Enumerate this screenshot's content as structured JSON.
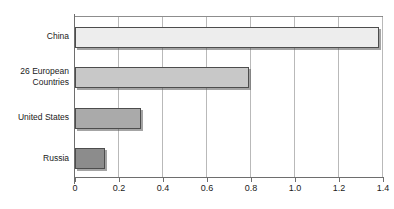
{
  "chart_data": {
    "type": "bar",
    "orientation": "horizontal",
    "title": "",
    "xlabel": "",
    "ylabel": "",
    "xlim": [
      0,
      1.4
    ],
    "grid": true,
    "legend": "none",
    "categories": [
      "China",
      "26 European Countries",
      "United States",
      "Russia"
    ],
    "category_lines": [
      [
        "China"
      ],
      [
        "26 European",
        "Countries"
      ],
      [
        "United States"
      ],
      [
        "Russia"
      ]
    ],
    "values": [
      1.38,
      0.79,
      0.3,
      0.135
    ],
    "tick_labels": [
      "0",
      "0.2",
      "0.4",
      "0.6",
      "0.8",
      "1.0",
      "1.2",
      "1.4"
    ],
    "tick_values": [
      0,
      0.2,
      0.4,
      0.6,
      0.8,
      1.0,
      1.2,
      1.4
    ],
    "bar_colors": [
      "#ededed",
      "#c8c8c8",
      "#aaaaaa",
      "#8c8c8c"
    ],
    "bar_border_color": "#4d4d4d",
    "gridline_color": "#b9b9b9",
    "axis_color": "#6e6e6e",
    "background_color": "#ffffff"
  }
}
